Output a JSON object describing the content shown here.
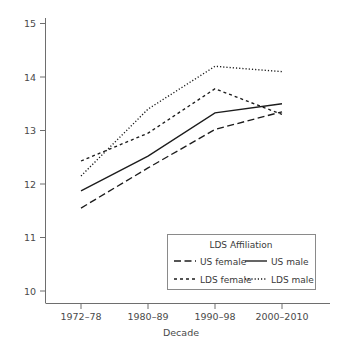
{
  "chart_data": {
    "type": "line",
    "title": "",
    "xlabel": "Decade",
    "ylabel": "",
    "categories": [
      "1972–78",
      "1980–89",
      "1990–98",
      "2000–2010"
    ],
    "yticks": [
      10,
      11,
      12,
      13,
      14,
      15
    ],
    "ylim": [
      9.75,
      15.3
    ],
    "grid": false,
    "legend_position": "bottom-right",
    "legend_title": "LDS Affiliation",
    "series": [
      {
        "name": "US female",
        "linestyle": "long-dash",
        "values": [
          11.55,
          12.3,
          13.02,
          13.35
        ]
      },
      {
        "name": "US male",
        "linestyle": "solid",
        "values": [
          11.87,
          12.52,
          13.33,
          13.5
        ]
      },
      {
        "name": "LDS female",
        "linestyle": "short-dash",
        "values": [
          12.43,
          12.95,
          13.78,
          13.3
        ]
      },
      {
        "name": "LDS male",
        "linestyle": "dotted",
        "values": [
          12.15,
          13.4,
          14.2,
          14.1
        ]
      }
    ]
  },
  "axes": {
    "x_title": "Decade",
    "x_tick_labels": [
      "1972–78",
      "1980–89",
      "1990–98",
      "2000–2010"
    ],
    "y_tick_labels": [
      "15",
      "14",
      "13",
      "12",
      "11",
      "10"
    ]
  },
  "legend": {
    "title": "LDS Affiliation",
    "entries": [
      {
        "label": "US female",
        "style": "long-dash"
      },
      {
        "label": "US male",
        "style": "solid"
      },
      {
        "label": "LDS female",
        "style": "short-dash"
      },
      {
        "label": "LDS male",
        "style": "dotted"
      }
    ]
  },
  "colors": {
    "line": "#1c1c1c",
    "axis": "#6e6e6e",
    "text": "#4a4a4a",
    "background": "#ffffff"
  }
}
